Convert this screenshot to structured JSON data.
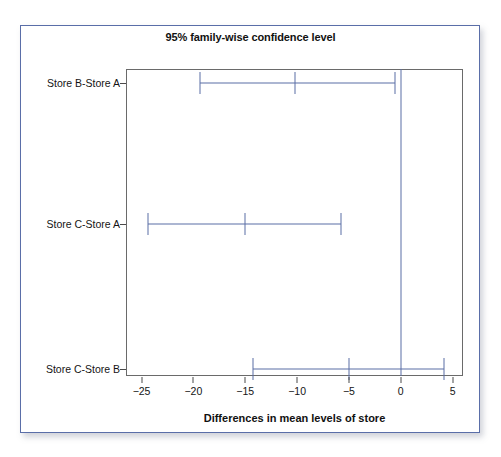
{
  "figure": {
    "title": "95% family-wise confidence level",
    "x_axis_title": "Differences in mean levels of store",
    "accent_color": "#5b6fa6",
    "frame_color": "#5a6ea8",
    "axis_color": "#4b4b4b"
  },
  "chart_data": {
    "type": "error-bar",
    "title": "95% family-wise confidence level",
    "subtitle": "",
    "xlabel": "Differences in mean levels of store",
    "ylabel": "",
    "orientation": "horizontal",
    "xlim": [
      -26.5,
      6.0
    ],
    "xticks": [
      -25,
      -20,
      -15,
      -10,
      -5,
      0,
      5
    ],
    "xtick_labels": [
      "−25",
      "−20",
      "−15",
      "−10",
      "−5",
      "0",
      "5"
    ],
    "grid": false,
    "legend": "none",
    "reference_line": 0,
    "categories": [
      "Store B-Store A",
      "Store C-Store A",
      "Store C-Store B"
    ],
    "series": [
      {
        "name": "Store B-Store A",
        "center": -10.2,
        "lower": -19.4,
        "upper": -0.6
      },
      {
        "name": "Store C-Store A",
        "center": -15.0,
        "lower": -24.4,
        "upper": -5.8
      },
      {
        "name": "Store C-Store B",
        "center": -5.0,
        "lower": -14.3,
        "upper": 4.2
      }
    ]
  }
}
